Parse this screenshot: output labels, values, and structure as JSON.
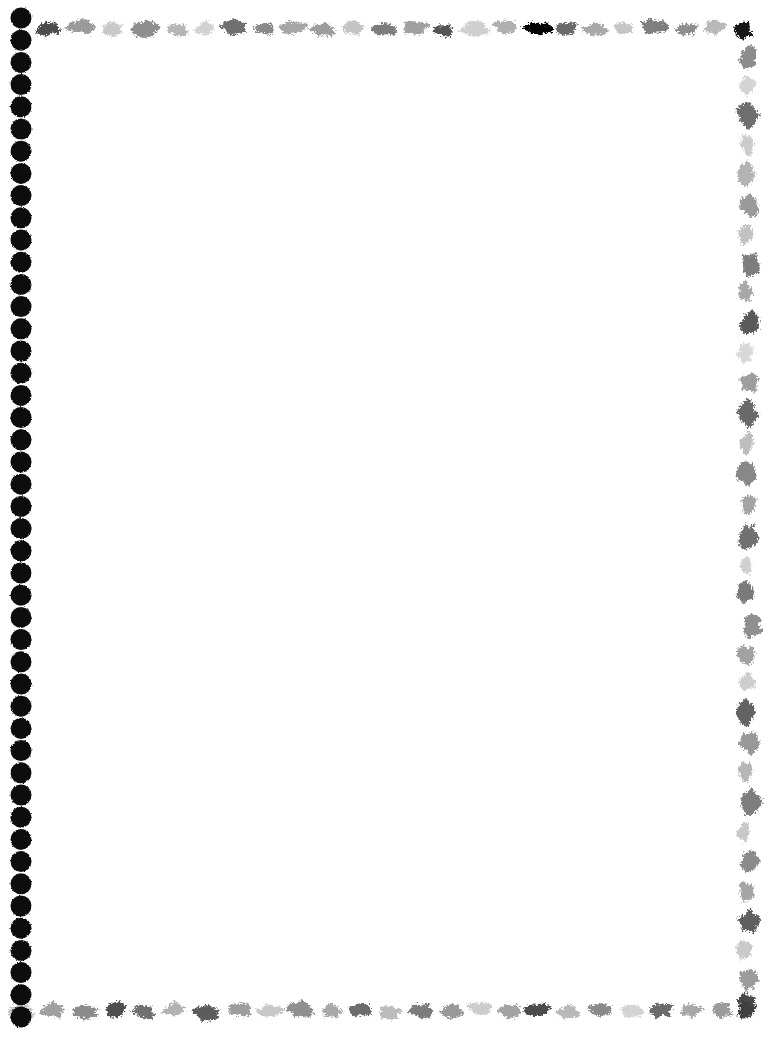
{
  "page": {
    "width": 778,
    "height": 1042,
    "background_color": "#ffffff",
    "body_text": "",
    "content_area": {
      "label": "",
      "left": 48,
      "top": 48,
      "width": 662,
      "height": 930
    }
  },
  "border": {
    "style_name": "hand-painted-brushstroke-border",
    "left_edge": {
      "name": "dotted-column",
      "shape": "circle",
      "color": "#0a0a0a",
      "dot_diameter": 21,
      "spacing": 22.2,
      "center_x": 21,
      "start_y": 18,
      "count": 46
    },
    "top_edge": {
      "name": "brushstroke-row-top",
      "orientation": "horizontal",
      "baseline_y": 20,
      "start_x": 34,
      "end_x": 748,
      "strokes": [
        {
          "x": 36,
          "y": 21,
          "w": 26,
          "h": 15,
          "fill": "#4d4d4d",
          "rot": -3
        },
        {
          "x": 66,
          "y": 19,
          "w": 30,
          "h": 16,
          "fill": "#9a9a9a",
          "rot": 2
        },
        {
          "x": 100,
          "y": 22,
          "w": 24,
          "h": 14,
          "fill": "#c9c9c9",
          "rot": -2
        },
        {
          "x": 128,
          "y": 20,
          "w": 32,
          "h": 17,
          "fill": "#8e8e8e",
          "rot": 3
        },
        {
          "x": 164,
          "y": 23,
          "w": 27,
          "h": 13,
          "fill": "#b5b5b5",
          "rot": -1
        },
        {
          "x": 194,
          "y": 21,
          "w": 22,
          "h": 14,
          "fill": "#d2d2d2",
          "rot": 2
        },
        {
          "x": 220,
          "y": 19,
          "w": 30,
          "h": 16,
          "fill": "#6f6f6f",
          "rot": -4
        },
        {
          "x": 254,
          "y": 22,
          "w": 20,
          "h": 13,
          "fill": "#8a8a8a",
          "rot": 1
        },
        {
          "x": 278,
          "y": 20,
          "w": 28,
          "h": 15,
          "fill": "#a6a6a6",
          "rot": -2
        },
        {
          "x": 310,
          "y": 23,
          "w": 26,
          "h": 14,
          "fill": "#9d9d9d",
          "rot": 3
        },
        {
          "x": 340,
          "y": 20,
          "w": 24,
          "h": 16,
          "fill": "#c4c4c4",
          "rot": -1
        },
        {
          "x": 368,
          "y": 22,
          "w": 30,
          "h": 15,
          "fill": "#7b7b7b",
          "rot": 2
        },
        {
          "x": 402,
          "y": 20,
          "w": 27,
          "h": 14,
          "fill": "#a0a0a0",
          "rot": -3
        },
        {
          "x": 432,
          "y": 23,
          "w": 23,
          "h": 13,
          "fill": "#545454",
          "rot": 1
        },
        {
          "x": 460,
          "y": 21,
          "w": 29,
          "h": 16,
          "fill": "#cfcfcf",
          "rot": 2
        },
        {
          "x": 494,
          "y": 19,
          "w": 25,
          "h": 15,
          "fill": "#b0b0b0",
          "rot": -2
        },
        {
          "x": 522,
          "y": 22,
          "w": 31,
          "h": 14,
          "fill": "#9696969",
          "rot": 3
        },
        {
          "x": 556,
          "y": 20,
          "w": 22,
          "h": 16,
          "fill": "#6b6b6b",
          "rot": -1
        },
        {
          "x": 582,
          "y": 23,
          "w": 27,
          "h": 13,
          "fill": "#a9a9a9",
          "rot": 2
        },
        {
          "x": 612,
          "y": 21,
          "w": 24,
          "h": 15,
          "fill": "#c6c6c6",
          "rot": -3
        },
        {
          "x": 640,
          "y": 19,
          "w": 30,
          "h": 16,
          "fill": "#7f7f7f",
          "rot": 1
        },
        {
          "x": 674,
          "y": 22,
          "w": 26,
          "h": 14,
          "fill": "#8d8d8d",
          "rot": 2
        },
        {
          "x": 704,
          "y": 20,
          "w": 22,
          "h": 15,
          "fill": "#b8b8b8",
          "rot": -2
        },
        {
          "x": 730,
          "y": 21,
          "w": 24,
          "h": 18,
          "fill": "#141414",
          "rot": 3
        }
      ]
    },
    "right_edge": {
      "name": "brushstroke-column-right",
      "orientation": "vertical",
      "center_x": 740,
      "start_y": 40,
      "end_y": 1000,
      "strokes": [
        {
          "x": 738,
          "y": 46,
          "w": 20,
          "h": 26,
          "fill": "#8c8c8c",
          "rot": 4
        },
        {
          "x": 740,
          "y": 76,
          "w": 16,
          "h": 20,
          "fill": "#d4d4d4",
          "rot": -3
        },
        {
          "x": 736,
          "y": 100,
          "w": 22,
          "h": 28,
          "fill": "#6e6e6e",
          "rot": 2
        },
        {
          "x": 740,
          "y": 134,
          "w": 15,
          "h": 22,
          "fill": "#cbcbcb",
          "rot": -2
        },
        {
          "x": 737,
          "y": 162,
          "w": 18,
          "h": 24,
          "fill": "#b3b3b3",
          "rot": 3
        },
        {
          "x": 739,
          "y": 192,
          "w": 20,
          "h": 26,
          "fill": "#9a9a9a",
          "rot": -1
        },
        {
          "x": 736,
          "y": 224,
          "w": 17,
          "h": 22,
          "fill": "#c2c2c2",
          "rot": 2
        },
        {
          "x": 740,
          "y": 250,
          "w": 21,
          "h": 27,
          "fill": "#7d7d7d",
          "rot": -3
        },
        {
          "x": 737,
          "y": 282,
          "w": 16,
          "h": 21,
          "fill": "#a8a8a8",
          "rot": 1
        },
        {
          "x": 739,
          "y": 308,
          "w": 22,
          "h": 29,
          "fill": "#5a5a5a",
          "rot": 3
        },
        {
          "x": 736,
          "y": 342,
          "w": 18,
          "h": 23,
          "fill": "#d8d8d8",
          "rot": -2
        },
        {
          "x": 740,
          "y": 370,
          "w": 19,
          "h": 25,
          "fill": "#9e9e9e",
          "rot": 2
        },
        {
          "x": 737,
          "y": 400,
          "w": 21,
          "h": 27,
          "fill": "#6a6a6a",
          "rot": -1
        },
        {
          "x": 739,
          "y": 432,
          "w": 16,
          "h": 22,
          "fill": "#bdbdbd",
          "rot": 3
        },
        {
          "x": 736,
          "y": 460,
          "w": 20,
          "h": 26,
          "fill": "#888888",
          "rot": -2
        },
        {
          "x": 740,
          "y": 492,
          "w": 18,
          "h": 24,
          "fill": "#a4a4a4",
          "rot": 1
        },
        {
          "x": 737,
          "y": 522,
          "w": 22,
          "h": 28,
          "fill": "#717171",
          "rot": 2
        },
        {
          "x": 739,
          "y": 556,
          "w": 15,
          "h": 20,
          "fill": "#d0d0d0",
          "rot": -3
        },
        {
          "x": 736,
          "y": 580,
          "w": 19,
          "h": 25,
          "fill": "#7a7a7a",
          "rot": 2
        },
        {
          "x": 740,
          "y": 610,
          "w": 23,
          "h": 29,
          "fill": "#8f8f8f",
          "rot": -1
        },
        {
          "x": 737,
          "y": 644,
          "w": 18,
          "h": 23,
          "fill": "#a2a2a2",
          "rot": 3
        },
        {
          "x": 739,
          "y": 672,
          "w": 16,
          "h": 21,
          "fill": "#cdcdcd",
          "rot": -2
        },
        {
          "x": 736,
          "y": 698,
          "w": 21,
          "h": 27,
          "fill": "#636363",
          "rot": 1
        },
        {
          "x": 740,
          "y": 730,
          "w": 19,
          "h": 25,
          "fill": "#989898",
          "rot": 2
        },
        {
          "x": 737,
          "y": 760,
          "w": 17,
          "h": 22,
          "fill": "#b6b6b6",
          "rot": -3
        },
        {
          "x": 739,
          "y": 788,
          "w": 22,
          "h": 28,
          "fill": "#7e7e7e",
          "rot": 1
        },
        {
          "x": 736,
          "y": 822,
          "w": 16,
          "h": 21,
          "fill": "#c8c8c8",
          "rot": 3
        },
        {
          "x": 740,
          "y": 848,
          "w": 20,
          "h": 26,
          "fill": "#8b8b8b",
          "rot": -2
        },
        {
          "x": 737,
          "y": 880,
          "w": 18,
          "h": 23,
          "fill": "#a5a5a5",
          "rot": 2
        },
        {
          "x": 739,
          "y": 908,
          "w": 21,
          "h": 27,
          "fill": "#5e5e5e",
          "rot": -1
        },
        {
          "x": 736,
          "y": 940,
          "w": 16,
          "h": 22,
          "fill": "#cacaca",
          "rot": 3
        },
        {
          "x": 740,
          "y": 966,
          "w": 19,
          "h": 26,
          "fill": "#9c9c9c",
          "rot": -2
        },
        {
          "x": 736,
          "y": 992,
          "w": 22,
          "h": 20,
          "fill": "#4a4a4a",
          "rot": 2
        }
      ]
    },
    "bottom_edge": {
      "name": "brushstroke-row-bottom",
      "orientation": "horizontal",
      "baseline_y": 1002,
      "start_x": 10,
      "end_x": 752,
      "strokes": [
        {
          "x": 8,
          "y": 1004,
          "w": 28,
          "h": 15,
          "fill": "#c3c3c3",
          "rot": 2
        },
        {
          "x": 40,
          "y": 1002,
          "w": 24,
          "h": 17,
          "fill": "#a0a0a0",
          "rot": -2
        },
        {
          "x": 70,
          "y": 1005,
          "w": 30,
          "h": 14,
          "fill": "#8b8b8b",
          "rot": 3
        },
        {
          "x": 104,
          "y": 1001,
          "w": 22,
          "h": 16,
          "fill": "#4f4f4f",
          "rot": -1
        },
        {
          "x": 130,
          "y": 1004,
          "w": 27,
          "h": 15,
          "fill": "#707070",
          "rot": 2
        },
        {
          "x": 162,
          "y": 1002,
          "w": 25,
          "h": 14,
          "fill": "#b2b2b2",
          "rot": -3
        },
        {
          "x": 192,
          "y": 1005,
          "w": 31,
          "h": 16,
          "fill": "#5c5c5c",
          "rot": 1
        },
        {
          "x": 228,
          "y": 1002,
          "w": 23,
          "h": 15,
          "fill": "#9d9d9d",
          "rot": 2
        },
        {
          "x": 256,
          "y": 1004,
          "w": 26,
          "h": 14,
          "fill": "#c7c7c7",
          "rot": -2
        },
        {
          "x": 286,
          "y": 1001,
          "w": 29,
          "h": 17,
          "fill": "#8f8f8f",
          "rot": 3
        },
        {
          "x": 320,
          "y": 1004,
          "w": 22,
          "h": 15,
          "fill": "#a8a8a8",
          "rot": -1
        },
        {
          "x": 346,
          "y": 1002,
          "w": 27,
          "h": 16,
          "fill": "#6d6d6d",
          "rot": 2
        },
        {
          "x": 378,
          "y": 1005,
          "w": 24,
          "h": 14,
          "fill": "#bcbcbc",
          "rot": -3
        },
        {
          "x": 406,
          "y": 1002,
          "w": 30,
          "h": 16,
          "fill": "#7b7b7b",
          "rot": 1
        },
        {
          "x": 440,
          "y": 1004,
          "w": 23,
          "h": 15,
          "fill": "#989898",
          "rot": 2
        },
        {
          "x": 468,
          "y": 1001,
          "w": 26,
          "h": 14,
          "fill": "#cccccc",
          "rot": -2
        },
        {
          "x": 498,
          "y": 1004,
          "w": 22,
          "h": 16,
          "fill": "#a3a3a3",
          "rot": 3
        },
        {
          "x": 524,
          "y": 1002,
          "w": 28,
          "h": 15,
          "fill": "#4c4c4c",
          "rot": -1
        },
        {
          "x": 556,
          "y": 1005,
          "w": 25,
          "h": 14,
          "fill": "#b9b9b9",
          "rot": 2
        },
        {
          "x": 586,
          "y": 1002,
          "w": 30,
          "h": 16,
          "fill": "#8a8a8a",
          "rot": -3
        },
        {
          "x": 620,
          "y": 1004,
          "w": 24,
          "h": 15,
          "fill": "#d3d3d3",
          "rot": 1
        },
        {
          "x": 648,
          "y": 1001,
          "w": 27,
          "h": 17,
          "fill": "#6a6a6a",
          "rot": 2
        },
        {
          "x": 680,
          "y": 1004,
          "w": 23,
          "h": 14,
          "fill": "#a7a7a7",
          "rot": -2
        },
        {
          "x": 708,
          "y": 1002,
          "w": 26,
          "h": 16,
          "fill": "#9b9b9b",
          "rot": 3
        },
        {
          "x": 736,
          "y": 1000,
          "w": 20,
          "h": 18,
          "fill": "#3f3f3f",
          "rot": -2
        }
      ]
    }
  }
}
